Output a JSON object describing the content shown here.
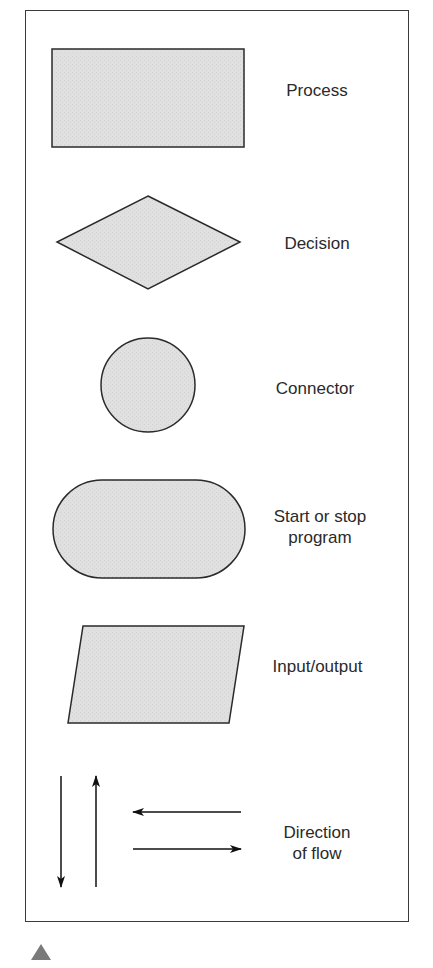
{
  "diagram": {
    "fill_color": "#e2e2e2",
    "stroke_color": "#2a2a2a",
    "symbols": [
      {
        "shape": "rectangle",
        "label_lines": [
          "Process"
        ]
      },
      {
        "shape": "diamond",
        "label_lines": [
          "Decision"
        ]
      },
      {
        "shape": "circle",
        "label_lines": [
          "Connector"
        ]
      },
      {
        "shape": "rounded-stadium",
        "label_lines": [
          "Start or stop",
          "program"
        ]
      },
      {
        "shape": "parallelogram",
        "label_lines": [
          "Input/output"
        ]
      },
      {
        "shape": "arrows",
        "label_lines": [
          "Direction",
          "of flow"
        ]
      }
    ]
  },
  "footer": {
    "marker": "triangle-marker-icon"
  }
}
